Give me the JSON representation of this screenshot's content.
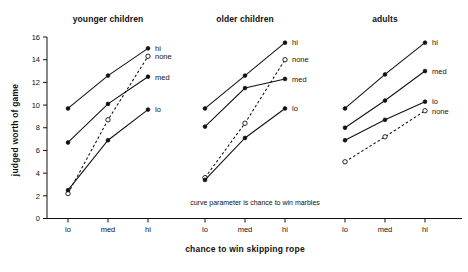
{
  "figure": {
    "y_axis_label": "judged worth of game",
    "x_axis_label": "chance to win skipping rope",
    "annotation": "curve parameter is chance to win marbles",
    "y_ticks": [
      "0",
      "2",
      "4",
      "6",
      "8",
      "10",
      "12",
      "14",
      "16"
    ],
    "x_ticks": [
      "lo",
      "med",
      "hi"
    ],
    "panel_titles": [
      "younger children",
      "older children",
      "adults"
    ],
    "series_labels": [
      "hi",
      "none",
      "med",
      "lo"
    ],
    "ink_color": "#111111",
    "background_color": "#ffffff"
  },
  "chart_data": {
    "type": "line",
    "title": "",
    "xlabel": "chance to win skipping rope",
    "ylabel": "judged worth of game",
    "ylim": [
      0,
      16
    ],
    "ytick_values": [
      0,
      2,
      4,
      6,
      8,
      10,
      12,
      14,
      16
    ],
    "grid": false,
    "legend": "inline-right-of-each-panel",
    "annotation": "curve parameter is chance to win marbles",
    "categories": [
      "lo",
      "med",
      "hi"
    ],
    "panels": [
      {
        "name": "younger children",
        "series": [
          {
            "name": "hi",
            "marker": "filled-circle",
            "line": "solid",
            "values": [
              9.7,
              12.6,
              15.0
            ]
          },
          {
            "name": "none",
            "marker": "open-circle",
            "line": "dashed",
            "values": [
              2.2,
              8.7,
              14.3
            ]
          },
          {
            "name": "med",
            "marker": "filled-circle",
            "line": "solid",
            "values": [
              6.7,
              10.1,
              12.5
            ]
          },
          {
            "name": "lo",
            "marker": "filled-circle",
            "line": "solid",
            "values": [
              2.5,
              6.9,
              9.6
            ]
          }
        ]
      },
      {
        "name": "older children",
        "series": [
          {
            "name": "hi",
            "marker": "filled-circle",
            "line": "solid",
            "values": [
              9.7,
              12.6,
              15.5
            ]
          },
          {
            "name": "none",
            "marker": "open-circle",
            "line": "dashed",
            "values": [
              3.6,
              8.4,
              14.0
            ]
          },
          {
            "name": "med",
            "marker": "filled-circle",
            "line": "solid",
            "values": [
              8.1,
              11.5,
              12.3
            ]
          },
          {
            "name": "lo",
            "marker": "filled-circle",
            "line": "solid",
            "values": [
              3.4,
              7.1,
              9.7
            ]
          }
        ]
      },
      {
        "name": "adults",
        "series": [
          {
            "name": "hi",
            "marker": "filled-circle",
            "line": "solid",
            "values": [
              9.7,
              12.7,
              15.5
            ]
          },
          {
            "name": "med",
            "marker": "filled-circle",
            "line": "solid",
            "values": [
              8.0,
              10.4,
              13.0
            ]
          },
          {
            "name": "lo",
            "marker": "filled-circle",
            "line": "solid",
            "values": [
              6.9,
              8.7,
              10.3
            ]
          },
          {
            "name": "none",
            "marker": "open-circle",
            "line": "dashed",
            "values": [
              5.0,
              7.2,
              9.5
            ]
          }
        ]
      }
    ]
  }
}
